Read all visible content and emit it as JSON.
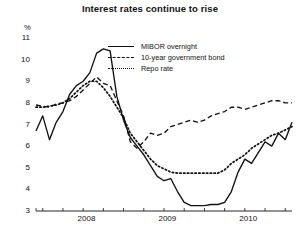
{
  "chart_data": {
    "type": "line",
    "title": "Interest rates continue to rise",
    "xlabel": "",
    "ylabel": "%",
    "ylim": [
      3,
      11
    ],
    "yticks": [
      3,
      4,
      5,
      6,
      7,
      8,
      9,
      10,
      11
    ],
    "xticklabels": [
      "2008",
      "2009",
      "2010"
    ],
    "grid": false,
    "legend_position": "top-center",
    "x": [
      "2007-10",
      "2007-11",
      "2007-12",
      "2008-01",
      "2008-02",
      "2008-03",
      "2008-04",
      "2008-05",
      "2008-06",
      "2008-07",
      "2008-08",
      "2008-09",
      "2008-10",
      "2008-11",
      "2008-12",
      "2009-01",
      "2009-02",
      "2009-03",
      "2009-04",
      "2009-05",
      "2009-06",
      "2009-07",
      "2009-08",
      "2009-09",
      "2009-10",
      "2009-11",
      "2009-12",
      "2010-01",
      "2010-02",
      "2010-03",
      "2010-04",
      "2010-05",
      "2010-06",
      "2010-07",
      "2010-08",
      "2010-09",
      "2010-10",
      "2010-11",
      "2010-12"
    ],
    "series": [
      {
        "name": "MIBOR overnight",
        "style": "solid",
        "color": "#111111",
        "values": [
          6.7,
          7.4,
          6.3,
          7.1,
          7.6,
          8.4,
          8.8,
          9.0,
          9.4,
          10.3,
          10.5,
          10.4,
          8.3,
          7.2,
          6.4,
          6.0,
          5.6,
          5.1,
          4.6,
          4.4,
          4.5,
          3.9,
          3.4,
          3.25,
          3.25,
          3.25,
          3.3,
          3.3,
          3.4,
          3.9,
          4.8,
          5.4,
          5.2,
          5.7,
          6.2,
          6.0,
          6.6,
          6.3,
          7.1
        ]
      },
      {
        "name": "10-year government bond",
        "style": "dashed",
        "color": "#111111",
        "values": [
          7.9,
          7.85,
          7.8,
          7.95,
          8.0,
          8.1,
          8.3,
          8.6,
          8.9,
          9.2,
          8.9,
          8.8,
          8.1,
          7.4,
          6.2,
          5.9,
          6.2,
          6.6,
          6.5,
          6.6,
          6.9,
          7.0,
          7.1,
          7.2,
          7.1,
          7.2,
          7.4,
          7.5,
          7.6,
          7.8,
          7.8,
          7.7,
          7.8,
          7.9,
          8.0,
          8.1,
          8.1,
          8.0,
          8.0
        ]
      },
      {
        "name": "Repo rate",
        "style": "dotted",
        "color": "#111111",
        "values": [
          7.8,
          7.8,
          7.85,
          7.9,
          8.0,
          8.2,
          8.5,
          8.8,
          9.0,
          9.0,
          8.7,
          8.3,
          7.8,
          7.3,
          6.6,
          6.2,
          5.8,
          5.4,
          5.1,
          4.95,
          4.8,
          4.75,
          4.75,
          4.75,
          4.75,
          4.75,
          4.75,
          4.75,
          4.9,
          5.2,
          5.4,
          5.6,
          5.9,
          6.1,
          6.3,
          6.5,
          6.6,
          6.75,
          6.9
        ]
      }
    ]
  }
}
